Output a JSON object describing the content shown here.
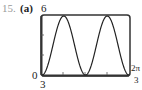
{
  "problem": {
    "number": "15.",
    "part": "(a)"
  },
  "chart_data": {
    "type": "line",
    "title": "",
    "xlabel": "",
    "ylabel": "",
    "xlim": [
      0,
      2.0944
    ],
    "ylim": [
      0,
      6
    ],
    "x_tick_labels": {
      "left": "0",
      "right_num": "2π",
      "right_den": "3"
    },
    "y_tick_labels": {
      "top": "6",
      "bottom": "0"
    },
    "y_bottom_note": "3",
    "function": "y = 3 - 3cos(6x)",
    "series": [
      {
        "name": "curve",
        "x": [
          0,
          0.2618,
          0.5236,
          0.7854,
          1.0472,
          1.309,
          1.5708,
          1.8326,
          2.0944
        ],
        "values": [
          0,
          3,
          6,
          3,
          0,
          3,
          6,
          3,
          0
        ]
      }
    ],
    "grid": false,
    "x_ticks": 5,
    "y_ticks": 3
  }
}
